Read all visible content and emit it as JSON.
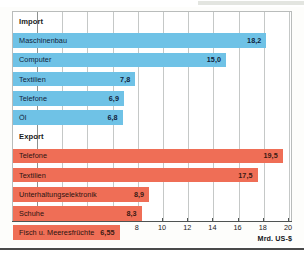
{
  "chart_data": {
    "type": "bar",
    "orientation": "horizontal",
    "title": "",
    "xlabel": "Mrd. US-$",
    "ylabel": "",
    "xlim": [
      0,
      20
    ],
    "xticks": [
      0,
      2,
      4,
      6,
      8,
      10,
      12,
      14,
      16,
      18,
      20
    ],
    "xtick_labels": [
      "0",
      "2",
      "4",
      "6",
      "8",
      "10",
      "12",
      "14",
      "16",
      "18",
      "20"
    ],
    "grid": true,
    "legend": "none",
    "groups": [
      {
        "name": "Import",
        "color": "#6fc2e6",
        "categories": [
          "Maschinenbau",
          "Computer",
          "Textilien",
          "Telefone",
          "Öl"
        ],
        "values": [
          18.2,
          15.0,
          7.8,
          6.9,
          6.8
        ],
        "value_labels": [
          "18,2",
          "15,0",
          "7,8",
          "6,9",
          "6,8"
        ]
      },
      {
        "name": "Export",
        "color": "#ef6e56",
        "categories": [
          "Telefone",
          "Textilien",
          "Unterhaltungselektronik",
          "Schuhe",
          "Fisch u. Meeresfrüchte"
        ],
        "values": [
          19.5,
          17.5,
          8.9,
          8.3,
          6.55
        ],
        "value_labels": [
          "19,5",
          "17,5",
          "8,9",
          "8,3",
          "6,55"
        ]
      }
    ]
  },
  "colors": {
    "import_bar": "#6fc2e6",
    "export_bar": "#ef6e56",
    "gridline": "#c5c8c7",
    "axis": "#4f5352",
    "frame": "#b9bcbb",
    "text": "#1b1b1b"
  }
}
